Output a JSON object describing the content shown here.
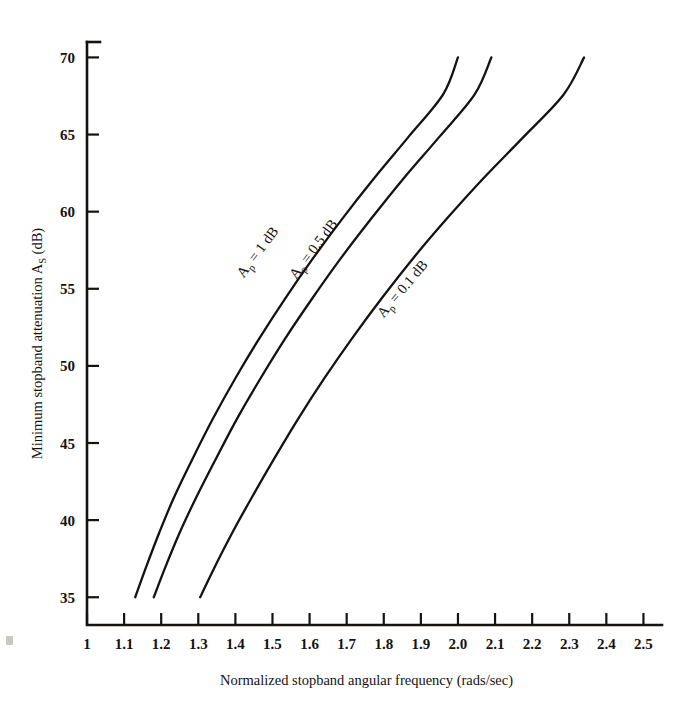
{
  "figure": {
    "background_color": "#ffffff",
    "ink_color": "#15120f",
    "margin_mark": "scan-artifact"
  },
  "chart_data": {
    "type": "line",
    "title": "",
    "xlabel": "Normalized stopband angular frequency (rads/sec)",
    "ylabel": "Minimum stopband attenuation A",
    "ylabel_subscript": "S",
    "ylabel_suffix": " (dB)",
    "xlim": [
      1.0,
      2.55
    ],
    "ylim": [
      33.2,
      71.0
    ],
    "xticks": [
      1.0,
      1.1,
      1.2,
      1.3,
      1.4,
      1.5,
      1.6,
      1.7,
      1.8,
      1.9,
      2.0,
      2.1,
      2.2,
      2.3,
      2.4,
      2.5
    ],
    "xticklabels": [
      "1",
      "1.1",
      "1.2",
      "1.3",
      "1.4",
      "1.5",
      "1.6",
      "1.7",
      "1.8",
      "1.9",
      "2.0",
      "2.1",
      "2.2",
      "2.3",
      "2.4",
      "2.5"
    ],
    "yticks": [
      35,
      40,
      45,
      50,
      55,
      60,
      65,
      70
    ],
    "yticklabels": [
      "35",
      "40",
      "45",
      "50",
      "55",
      "60",
      "65",
      "70"
    ],
    "grid": false,
    "legend": "inline-curve-labels",
    "series": [
      {
        "name": "Ap = 1 dB",
        "label_prefix": "A",
        "label_subscript": "p",
        "label_suffix": " = 1 dB",
        "label_x": 1.47,
        "label_y": 57.2,
        "label_rotation": -53,
        "x": [
          1.13,
          1.16,
          1.195,
          1.235,
          1.285,
          1.34,
          1.4,
          1.465,
          1.535,
          1.61,
          1.69,
          1.775,
          1.865,
          1.96,
          2.0
        ],
        "y": [
          35.0,
          37.0,
          39.2,
          41.5,
          44.0,
          46.6,
          49.2,
          51.8,
          54.4,
          57.0,
          59.6,
          62.2,
          64.8,
          67.6,
          70.0
        ]
      },
      {
        "name": "Ap = 0.5 dB",
        "label_prefix": "A",
        "label_subscript": "p",
        "label_suffix": " = 0.5 dB",
        "label_x": 1.62,
        "label_y": 57.4,
        "label_rotation": -53,
        "x": [
          1.18,
          1.212,
          1.25,
          1.295,
          1.348,
          1.405,
          1.468,
          1.535,
          1.608,
          1.685,
          1.768,
          1.855,
          1.948,
          2.045,
          2.09
        ],
        "y": [
          35.0,
          37.0,
          39.2,
          41.5,
          44.0,
          46.6,
          49.2,
          51.8,
          54.4,
          57.0,
          59.6,
          62.2,
          64.8,
          67.6,
          70.0
        ]
      },
      {
        "name": "Ap = 0.1 dB",
        "label_prefix": "A",
        "label_subscript": "p",
        "label_suffix": " = 0.1 dB",
        "label_x": 1.86,
        "label_y": 54.8,
        "label_rotation": -50,
        "x": [
          1.305,
          1.345,
          1.392,
          1.445,
          1.505,
          1.57,
          1.64,
          1.715,
          1.795,
          1.88,
          1.972,
          2.07,
          2.175,
          2.285,
          2.34
        ],
        "y": [
          35.0,
          37.0,
          39.2,
          41.5,
          44.0,
          46.6,
          49.2,
          51.8,
          54.4,
          57.0,
          59.6,
          62.2,
          64.8,
          67.6,
          70.0
        ]
      }
    ]
  }
}
